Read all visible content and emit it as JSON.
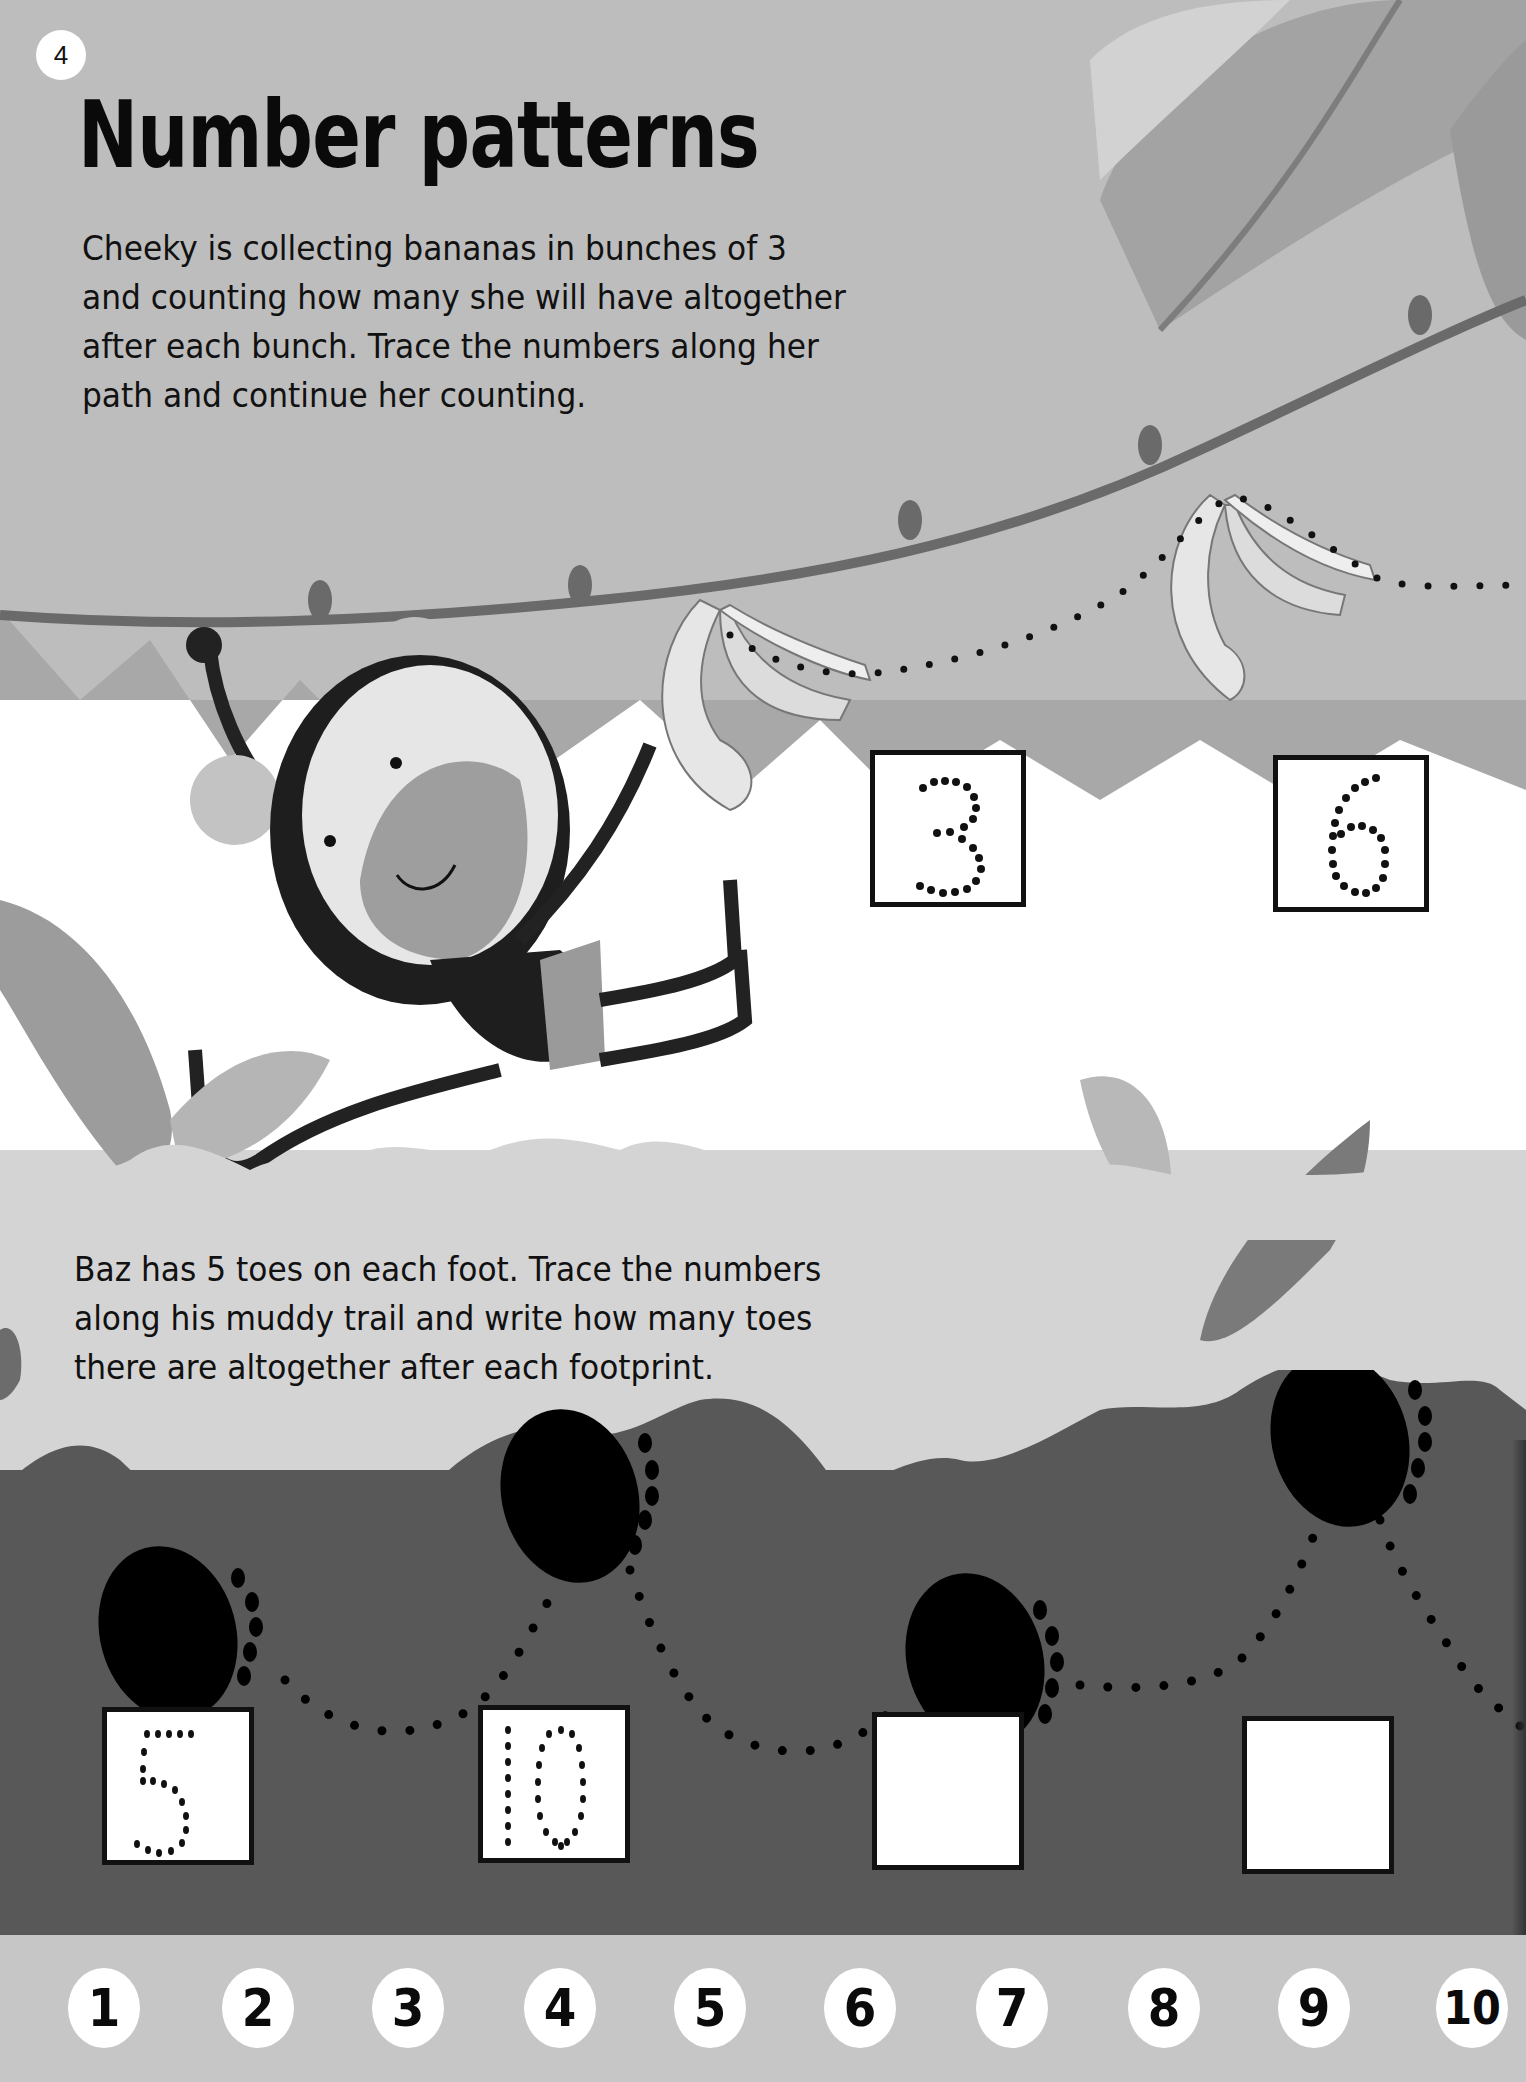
{
  "page": {
    "number": "4",
    "title": "Number patterns"
  },
  "section1": {
    "instructions": "Cheeky is collecting bananas in bunches of 3\nand counting how many she will have altogether\nafter each bunch. Trace the numbers along her\npath and continue her counting.",
    "character": "monkey",
    "boxes": [
      {
        "value": "3",
        "style": "dotted-trace"
      },
      {
        "value": "6",
        "style": "dotted-trace"
      }
    ]
  },
  "section2": {
    "instructions": "Baz has 5 toes on each foot. Trace the numbers\nalong his muddy trail and write how many toes\nthere are altogether after each footprint.",
    "footprints": 4,
    "boxes": [
      {
        "value": "5",
        "style": "dotted-trace"
      },
      {
        "value": "10",
        "style": "dotted-trace"
      },
      {
        "value": "",
        "style": "blank"
      },
      {
        "value": "",
        "style": "blank"
      }
    ]
  },
  "number_line": [
    "1",
    "2",
    "3",
    "4",
    "5",
    "6",
    "7",
    "8",
    "9",
    "10"
  ],
  "colors": {
    "sky_top": "#bdbdbd",
    "sky_mid": "#ffffff",
    "mud": "#585858",
    "strip": "#c6c6c6",
    "ink": "#111111"
  }
}
